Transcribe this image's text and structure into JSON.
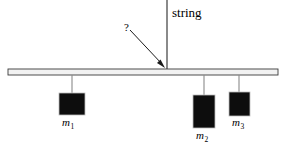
{
  "figure": {
    "background_color": "#ffffff",
    "stroke_color": "#000000",
    "bar_fill_color": "#f2f2f2",
    "mass_fill_color": "#0d0d0d",
    "width": 285,
    "height": 148
  },
  "labels": {
    "string": "string",
    "question": "?",
    "mass_1": "m",
    "mass_1_sub": "1",
    "mass_2": "m",
    "mass_2_sub": "2",
    "mass_3": "m",
    "mass_3_sub": "3"
  },
  "geometry": {
    "bar": {
      "x": 8,
      "y": 69,
      "width": 270,
      "height": 6
    },
    "support_string": {
      "x": 167,
      "y_top": 0,
      "y_bottom": 69
    },
    "pointer_arrow": {
      "x1": 130,
      "y1": 30,
      "x2": 164,
      "y2": 66
    },
    "masses": [
      {
        "name": "mass-1",
        "box_x": 59,
        "box_y": 93,
        "box_w": 26,
        "box_h": 22,
        "string_x": 72,
        "string_y_top": 75,
        "string_y_bottom": 93
      },
      {
        "name": "mass-2",
        "box_x": 193,
        "box_y": 95,
        "box_w": 22,
        "box_h": 33,
        "string_x": 204,
        "string_y_top": 75,
        "string_y_bottom": 95
      },
      {
        "name": "mass-3",
        "box_x": 229,
        "box_y": 92,
        "box_w": 21,
        "box_h": 24,
        "string_x": 239,
        "string_y_top": 75,
        "string_y_bottom": 92
      }
    ]
  }
}
